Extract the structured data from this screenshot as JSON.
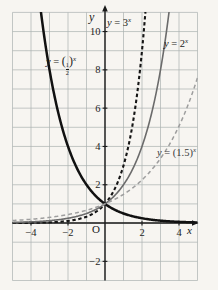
{
  "figure": {
    "width": 218,
    "height": 290
  },
  "colors": {
    "background": "#f7f5f1",
    "grid": "#aab2b0",
    "axis": "#1a1a1a",
    "tick_text": "#1f1f1f",
    "curve_3x": "#151515",
    "curve_2x": "#6b6b6b",
    "curve_15x": "#9e9e9e",
    "curve_half": "#111111"
  },
  "labels": {
    "y_axis": "y",
    "x_axis": "x",
    "origin": "O",
    "curve_3": {
      "var": "y",
      "eq": " = ",
      "val": "3",
      "sup": "x"
    },
    "curve_2": {
      "var": "y",
      "eq": " = ",
      "val": "2",
      "sup": "x"
    },
    "curve_15": {
      "var": "y",
      "eq": " = ",
      "val": "(1.5)",
      "sup": "x"
    },
    "curve_half": {
      "var": "y",
      "eq": " = ",
      "open": "(",
      "num": "1",
      "den": "2",
      "close": ")",
      "sup": "x"
    }
  },
  "chart_data": {
    "type": "line",
    "title": "",
    "xlabel": "x",
    "ylabel": "y",
    "origin_label": "O",
    "xlim": [
      -5,
      5
    ],
    "ylim": [
      -3,
      11
    ],
    "grid": true,
    "grid_step": 1,
    "x_ticks": [
      -4,
      -2,
      2,
      4
    ],
    "y_ticks": [
      -2,
      2,
      4,
      6,
      8,
      10
    ],
    "plot_rect": {
      "left": 12.5,
      "right": 197.5,
      "top": 12.4,
      "bottom": 280.5
    },
    "legend_position": "labels-on-curves",
    "series": [
      {
        "name": "y = (1/2)^x",
        "type_fn": "exponential",
        "base": 0.5,
        "style": "solid",
        "color": "#111111",
        "width": 2.5,
        "dash": null,
        "sample_points": {
          "x": [
            -3.46,
            -3,
            -2,
            -1,
            0,
            1,
            2,
            3,
            4,
            5
          ],
          "y": [
            11,
            8,
            4,
            2,
            1,
            0.5,
            0.25,
            0.125,
            0.0625,
            0.03125
          ]
        }
      },
      {
        "name": "y = 3^x",
        "type_fn": "exponential",
        "base": 3,
        "style": "dashed",
        "color": "#151515",
        "width": 2.1,
        "dash": "3.4 2.6",
        "sample_points": {
          "x": [
            -5,
            -2,
            -1,
            0,
            1,
            2,
            2.18
          ],
          "y": [
            0.004,
            0.111,
            0.333,
            1,
            3,
            9,
            11
          ]
        }
      },
      {
        "name": "y = 2^x",
        "type_fn": "exponential",
        "base": 2,
        "style": "solid",
        "color": "#6b6b6b",
        "width": 1.6,
        "dash": null,
        "sample_points": {
          "x": [
            -5,
            -2,
            -1,
            0,
            1,
            2,
            3,
            3.46
          ],
          "y": [
            0.031,
            0.25,
            0.5,
            1,
            2,
            4,
            8,
            11
          ]
        }
      },
      {
        "name": "y = (1.5)^x",
        "type_fn": "exponential",
        "base": 1.5,
        "style": "dashed",
        "color": "#9e9e9e",
        "width": 1.5,
        "dash": "4 3",
        "sample_points": {
          "x": [
            -5,
            -2,
            0,
            1,
            2,
            3,
            4,
            5
          ],
          "y": [
            0.13,
            0.44,
            1,
            1.5,
            2.25,
            3.375,
            5.06,
            7.59
          ]
        }
      }
    ]
  }
}
